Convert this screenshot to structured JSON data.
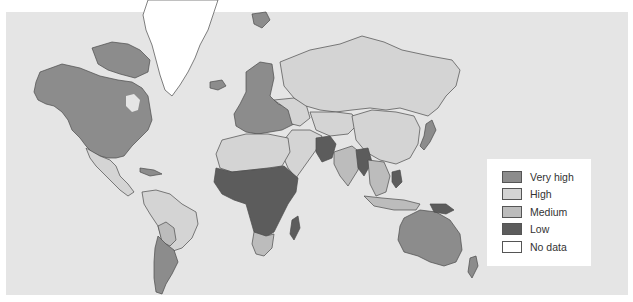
{
  "map": {
    "type": "choropleth",
    "region": "World",
    "background_color": "#e5e5e5",
    "border_color": "#4a4a4a"
  },
  "legend": {
    "items": [
      {
        "label": "Very high",
        "color": "#8c8c8c"
      },
      {
        "label": "High",
        "color": "#d4d4d4"
      },
      {
        "label": "Medium",
        "color": "#bcbcbc"
      },
      {
        "label": "Low",
        "color": "#5c5c5c"
      },
      {
        "label": "No data",
        "color": "#ffffff"
      }
    ]
  },
  "regions": [
    {
      "name": "North America (USA, Canada)",
      "category": "Very high"
    },
    {
      "name": "Alaska",
      "category": "Very high"
    },
    {
      "name": "Greenland",
      "category": "No data"
    },
    {
      "name": "Iceland",
      "category": "Very high"
    },
    {
      "name": "Mexico & Central America",
      "category": "High"
    },
    {
      "name": "Northern South America & Brazil",
      "category": "High"
    },
    {
      "name": "Bolivia / Paraguay",
      "category": "Medium"
    },
    {
      "name": "Argentina / Chile",
      "category": "Very high"
    },
    {
      "name": "Western & Northern Europe",
      "category": "Very high"
    },
    {
      "name": "Eastern Europe",
      "category": "High"
    },
    {
      "name": "Russia",
      "category": "High"
    },
    {
      "name": "Central Asia",
      "category": "High"
    },
    {
      "name": "China",
      "category": "High"
    },
    {
      "name": "Japan",
      "category": "Very high"
    },
    {
      "name": "North Africa",
      "category": "High"
    },
    {
      "name": "Middle East",
      "category": "High"
    },
    {
      "name": "Sub-Saharan Africa",
      "category": "Low"
    },
    {
      "name": "Southern Africa",
      "category": "Medium"
    },
    {
      "name": "Madagascar",
      "category": "Low"
    },
    {
      "name": "Pakistan / Afghanistan",
      "category": "Low"
    },
    {
      "name": "India",
      "category": "Medium"
    },
    {
      "name": "Bangladesh / Myanmar",
      "category": "Low"
    },
    {
      "name": "Southeast Asia",
      "category": "Medium"
    },
    {
      "name": "Australia",
      "category": "Very high"
    },
    {
      "name": "New Zealand",
      "category": "Very high"
    }
  ]
}
